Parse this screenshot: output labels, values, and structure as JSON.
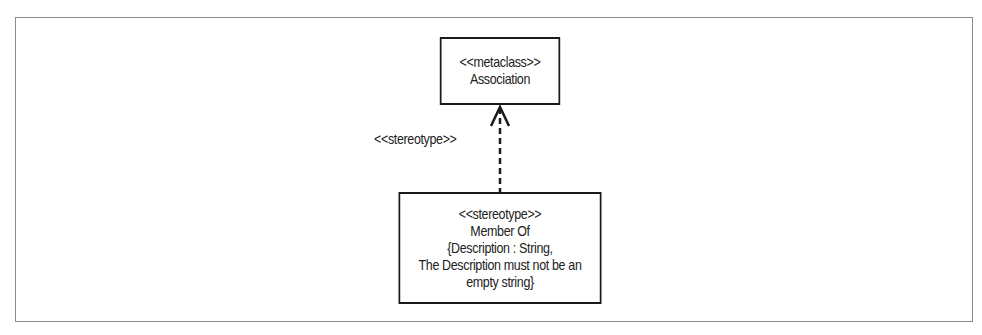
{
  "diagram": {
    "type": "UML profile diagram",
    "metaclass_box": {
      "stereotype_label": "<<metaclass>>",
      "name": "Association"
    },
    "stereotype_box": {
      "stereotype_label": "<<stereotype>>",
      "name": "Member Of",
      "constraint_lines": [
        "{Description : String,",
        "The Description must not be an",
        "empty string}"
      ]
    },
    "relationship": {
      "label": "<<stereotype>>",
      "style": "dashed",
      "arrowhead": "open",
      "from": "stereotype_box",
      "to": "metaclass_box"
    },
    "colors": {
      "line": "#1a1a1a",
      "frame": "#8a8a8a",
      "background": "#ffffff"
    }
  }
}
